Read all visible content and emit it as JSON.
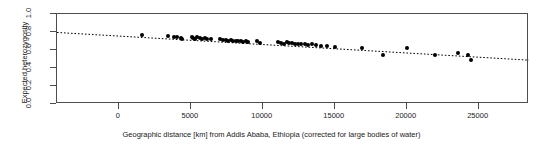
{
  "chart_data": {
    "type": "scatter",
    "title": "",
    "xlabel": "Geographic distance [km] from Addis Ababa, Ethiopia (corrected for large bodies of water)",
    "ylabel": "Expected heterozygosity",
    "xlim": [
      -4300,
      28500
    ],
    "ylim": [
      0.0,
      1.0
    ],
    "xticks": [
      0,
      5000,
      10000,
      15000,
      20000,
      25000
    ],
    "xticklabels": [
      "0",
      "5000",
      "10000",
      "15000",
      "20000",
      "25000"
    ],
    "yticks": [
      0.0,
      0.2,
      0.4,
      0.6,
      0.8,
      1.0
    ],
    "yticklabels": [
      "0.0",
      "0.2",
      "0.4",
      "0.6",
      "0.8",
      "1.0"
    ],
    "grid": false,
    "legend": null,
    "point_color": "#000000",
    "point_size": 4,
    "trendline": {
      "style": "dotted",
      "color": "#000000",
      "x_start": -4300,
      "y_start": 0.795,
      "x_end": 28500,
      "y_end": 0.487,
      "slope_per_km": -9.4e-06,
      "intercept": 0.7546
    },
    "points": [
      {
        "x": 1620,
        "y": 0.762
      },
      {
        "x": 3380,
        "y": 0.76
      },
      {
        "x": 3820,
        "y": 0.742
      },
      {
        "x": 4050,
        "y": 0.745
      },
      {
        "x": 4300,
        "y": 0.735
      },
      {
        "x": 4420,
        "y": 0.72
      },
      {
        "x": 5050,
        "y": 0.745
      },
      {
        "x": 5180,
        "y": 0.735
      },
      {
        "x": 5320,
        "y": 0.725
      },
      {
        "x": 5460,
        "y": 0.742
      },
      {
        "x": 5620,
        "y": 0.73
      },
      {
        "x": 5780,
        "y": 0.72
      },
      {
        "x": 5960,
        "y": 0.733
      },
      {
        "x": 6150,
        "y": 0.722
      },
      {
        "x": 6430,
        "y": 0.718
      },
      {
        "x": 7050,
        "y": 0.725
      },
      {
        "x": 7250,
        "y": 0.715
      },
      {
        "x": 7420,
        "y": 0.712
      },
      {
        "x": 7600,
        "y": 0.705
      },
      {
        "x": 7780,
        "y": 0.712
      },
      {
        "x": 7950,
        "y": 0.7
      },
      {
        "x": 8120,
        "y": 0.705
      },
      {
        "x": 8300,
        "y": 0.695
      },
      {
        "x": 8460,
        "y": 0.7
      },
      {
        "x": 8620,
        "y": 0.69
      },
      {
        "x": 8800,
        "y": 0.697
      },
      {
        "x": 9000,
        "y": 0.688
      },
      {
        "x": 9600,
        "y": 0.695
      },
      {
        "x": 9780,
        "y": 0.68
      },
      {
        "x": 11050,
        "y": 0.69
      },
      {
        "x": 11250,
        "y": 0.68
      },
      {
        "x": 11450,
        "y": 0.672
      },
      {
        "x": 11650,
        "y": 0.685
      },
      {
        "x": 11850,
        "y": 0.675
      },
      {
        "x": 12050,
        "y": 0.678
      },
      {
        "x": 12250,
        "y": 0.665
      },
      {
        "x": 12450,
        "y": 0.672
      },
      {
        "x": 12680,
        "y": 0.662
      },
      {
        "x": 12900,
        "y": 0.67
      },
      {
        "x": 13150,
        "y": 0.658
      },
      {
        "x": 13400,
        "y": 0.665
      },
      {
        "x": 13680,
        "y": 0.655
      },
      {
        "x": 14050,
        "y": 0.65
      },
      {
        "x": 14450,
        "y": 0.648
      },
      {
        "x": 15050,
        "y": 0.638
      },
      {
        "x": 16900,
        "y": 0.625
      },
      {
        "x": 18350,
        "y": 0.548
      },
      {
        "x": 20000,
        "y": 0.625
      },
      {
        "x": 22000,
        "y": 0.545
      },
      {
        "x": 23600,
        "y": 0.57
      },
      {
        "x": 24250,
        "y": 0.54
      },
      {
        "x": 24450,
        "y": 0.49
      }
    ]
  }
}
